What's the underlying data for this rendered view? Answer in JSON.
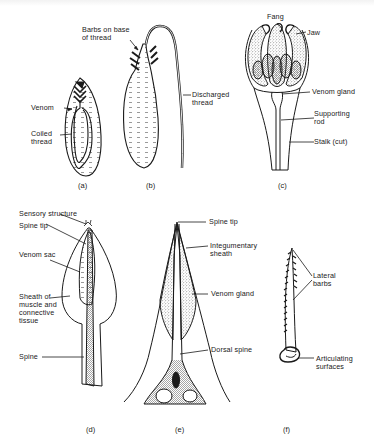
{
  "figure": {
    "panels": [
      {
        "id": "a",
        "caption": "(a)",
        "labels": {
          "venom": "Venom",
          "coiled_thread": "Coiled\nthread"
        }
      },
      {
        "id": "b",
        "caption": "(b)",
        "labels": {
          "barbs": "Barbs on base\nof thread",
          "discharged_thread": "Discharged\nthread"
        }
      },
      {
        "id": "c",
        "caption": "(c)",
        "labels": {
          "fang": "Fang",
          "jaw": "Jaw",
          "venom_gland": "Venom gland",
          "supporting_rod": "Supporting\nrod",
          "stalk": "Stalk (cut)"
        }
      },
      {
        "id": "d",
        "caption": "(d)",
        "labels": {
          "sensory_structure": "Sensory structure",
          "spine_tip": "Spine tip",
          "venom_sac": "Venom sac",
          "sheath": "Sheath of\nmuscle and\nconnective\ntissue",
          "spine": "Spine"
        }
      },
      {
        "id": "e",
        "caption": "(e)",
        "labels": {
          "spine_tip": "Spine tip",
          "integumentary_sheath": "Integumentary\nsheath",
          "venom_gland": "Venom gland",
          "dorsal_spine": "Dorsal spine"
        }
      },
      {
        "id": "f",
        "caption": "(f)",
        "labels": {
          "lateral_barbs": "Lateral\nbarbs",
          "articulating_surfaces": "Articulating\nsurfaces"
        }
      }
    ]
  },
  "colors": {
    "ink": "#1a1a1a",
    "background": "#ffffff",
    "stipple": "#555555"
  }
}
